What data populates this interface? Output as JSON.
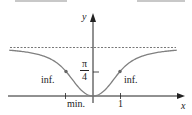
{
  "chart_data": {
    "type": "line",
    "title": "",
    "function_description": "y = arctan(x^2)",
    "xlabel": "x",
    "ylabel": "y",
    "x_ticks": [
      {
        "value": 1,
        "label": "1"
      }
    ],
    "y_ticks": [
      {
        "value": 0.785,
        "label": "π/4"
      }
    ],
    "asymptote": {
      "y": 1.571,
      "style": "dashed"
    },
    "annotations": [
      {
        "x": -1,
        "y": 0.785,
        "label": "inf."
      },
      {
        "x": 1,
        "y": 0.785,
        "label": "inf."
      },
      {
        "x": 0,
        "y": 0,
        "label": "min."
      }
    ],
    "x": [
      -3.4,
      -3,
      -2.5,
      -2,
      -1.5,
      -1,
      -0.5,
      0,
      0.5,
      1,
      1.5,
      2,
      2.5,
      3,
      3.4
    ],
    "values": [
      1.484,
      1.46,
      1.411,
      1.326,
      1.153,
      0.785,
      0.245,
      0,
      0.245,
      0.785,
      1.153,
      1.326,
      1.411,
      1.46,
      1.484
    ],
    "xlim": [
      -3.5,
      3.5
    ],
    "ylim": [
      -0.1,
      1.9
    ],
    "grid": false,
    "colors": {
      "curve": "#808080",
      "axis": "#222222",
      "dashed": "#555555",
      "points": "#666666"
    }
  },
  "labels": {
    "y_axis": "y",
    "x_axis": "x",
    "pi_num": "π",
    "pi_den": "4",
    "inf_left": "inf.",
    "inf_right": "inf.",
    "min": "min.",
    "one": "1"
  }
}
